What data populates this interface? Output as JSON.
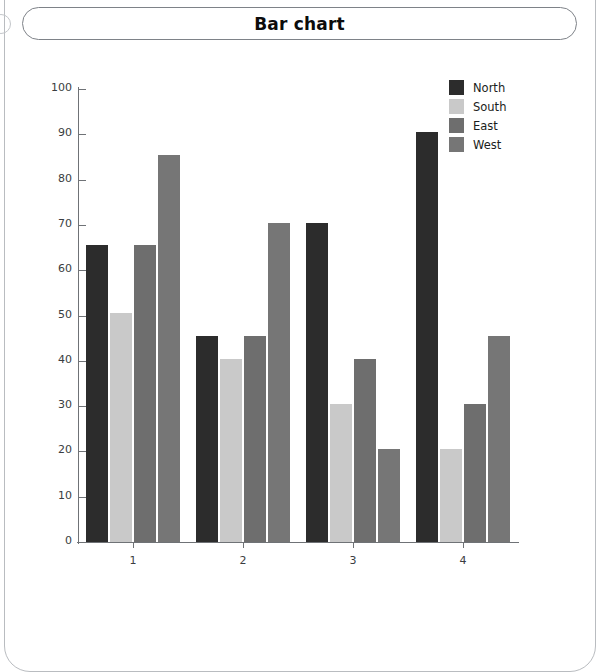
{
  "page": {
    "title": "Bar chart"
  },
  "chart_data": {
    "type": "bar",
    "title": "Bar chart",
    "xlabel": "",
    "ylabel": "",
    "ylim": [
      0,
      100
    ],
    "yticks": [
      0,
      10,
      20,
      30,
      40,
      50,
      60,
      70,
      80,
      90,
      100
    ],
    "grid": false,
    "legend_position": "top-right",
    "categories": [
      "1",
      "2",
      "3",
      "4"
    ],
    "series": [
      {
        "name": "North",
        "color": "#2c2c2c",
        "values": [
          65.5,
          45.5,
          70.5,
          90.5
        ]
      },
      {
        "name": "South",
        "color": "#c9c9c9",
        "values": [
          50.5,
          40.5,
          30.5,
          20.5
        ]
      },
      {
        "name": "East",
        "color": "#6e6e6e",
        "values": [
          65.5,
          45.5,
          40.5,
          30.5
        ]
      },
      {
        "name": "West",
        "color": "#767676",
        "values": [
          85.5,
          70.5,
          20.5,
          45.5
        ]
      }
    ]
  }
}
